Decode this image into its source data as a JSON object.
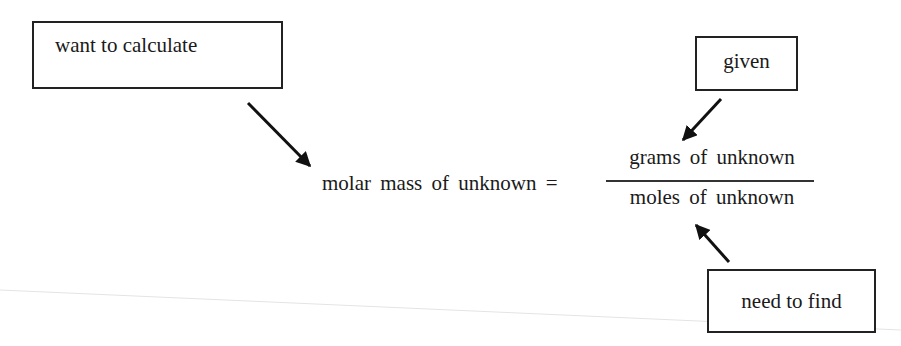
{
  "diagram": {
    "labels": {
      "want": "want to calculate",
      "given": "given",
      "need": "need to find"
    },
    "equation": {
      "lhs": "molar mass of unknown =",
      "numerator": "grams of unknown",
      "denominator": "moles of unknown"
    },
    "arrows": [
      {
        "from": "want",
        "to": "lhs"
      },
      {
        "from": "given",
        "to": "numerator"
      },
      {
        "from": "need",
        "to": "denominator"
      }
    ]
  }
}
